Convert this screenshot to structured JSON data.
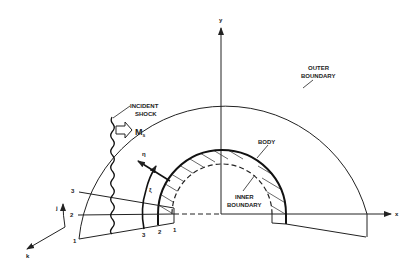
{
  "labels": {
    "outer_boundary_line1": "OUTER",
    "outer_boundary_line2": "BOUNDARY",
    "incident_shock_line1": "INCIDENT",
    "incident_shock_line2": "SHOCK",
    "shock_mach": "M",
    "shock_mach_sub": "s",
    "body": "BODY",
    "inner_boundary_line1": "INNER",
    "inner_boundary_line2": "BOUNDARY",
    "axis_x": "x",
    "axis_y": "y",
    "axis_j": "j",
    "axis_k": "k",
    "eta": "η",
    "xi": "ξ",
    "j_index_1": "1",
    "j_index_2": "2",
    "j_index_3": "3",
    "i_index_1": "1",
    "i_index_2": "2",
    "i_index_3": "3"
  },
  "colors": {
    "stroke": "#222222",
    "background": "#ffffff"
  }
}
